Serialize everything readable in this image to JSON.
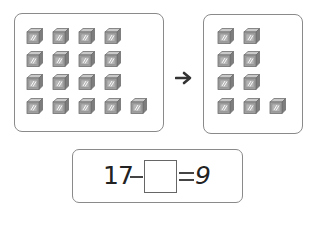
{
  "problem": {
    "before_group": {
      "count": 17,
      "rows": [
        4,
        4,
        4,
        5
      ],
      "item_icon": "cube-icon"
    },
    "arrow_icon": "right-arrow-icon",
    "after_group": {
      "count": 9,
      "rows": [
        2,
        2,
        2,
        3
      ],
      "item_icon": "cube-icon"
    },
    "equation": {
      "minuend": "17",
      "operator": "−",
      "blank": "",
      "equals": "=",
      "result": "9"
    }
  },
  "colors": {
    "border": "#8a8a8a",
    "cube_top": "#c9c9c9",
    "cube_front": "#9e9e9e",
    "cube_side": "#7d7d7d",
    "text": "#222222"
  }
}
